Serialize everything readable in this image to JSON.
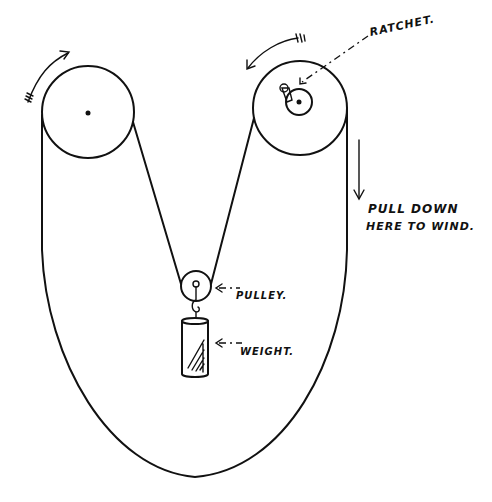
{
  "diagram": {
    "title": "",
    "labels": {
      "ratchet": "RATCHET.",
      "pull_down_line1": "PULL DOWN",
      "pull_down_line2": "HERE TO WIND.",
      "pulley": "PULLEY.",
      "weight": "WEIGHT."
    },
    "components": [
      {
        "id": "left-wheel",
        "type": "wheel",
        "rotation_arrow": "clockwise"
      },
      {
        "id": "right-wheel",
        "type": "wheel",
        "has_ratchet": true,
        "rotation_arrow": "counter-clockwise"
      },
      {
        "id": "pulley",
        "type": "pulley"
      },
      {
        "id": "weight",
        "type": "cylinder-weight"
      },
      {
        "id": "cord",
        "type": "endless-loop"
      }
    ],
    "colors": {
      "ink": "#111111",
      "background": "#ffffff"
    }
  }
}
